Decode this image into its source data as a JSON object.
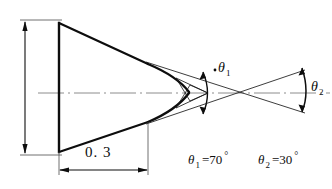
{
  "drawing": {
    "type": "engineering-cross-section",
    "description": "Axisymmetric projectile nose profile cross-section with cone half-angle callouts",
    "background_color": "#ffffff",
    "line_color": "#0d0d0d",
    "thin_line_color": "#1a1a1a",
    "centerline_color": "#8c8c8c",
    "labels": {
      "theta1": {
        "symbol": "θ",
        "subscript": "1"
      },
      "theta2": {
        "symbol": "θ",
        "subscript": "2"
      }
    },
    "dimensions": [
      {
        "name": "axial-length",
        "value": "0. 3",
        "orientation": "horizontal"
      }
    ],
    "equations": [
      {
        "name": "theta1-value",
        "symbol": "θ",
        "subscript": "1",
        "equals": "=70",
        "unit": "°"
      },
      {
        "name": "theta2-value",
        "symbol": "θ",
        "subscript": "2",
        "equals": "=30",
        "unit": "°"
      }
    ]
  }
}
